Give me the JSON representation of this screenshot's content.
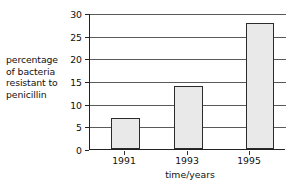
{
  "chart_data": {
    "type": "bar",
    "title": "",
    "subtitle": "",
    "categories": [
      "1991",
      "1993",
      "1995"
    ],
    "values": [
      7,
      14,
      28
    ],
    "xlabel": "time/years",
    "ylabel": "percentage of bacteria resistant to penicillin",
    "ylabel_lines": [
      "percentage",
      "of bacteria",
      "resistant to",
      "penicillin"
    ],
    "ylim": [
      0,
      30
    ],
    "ytick_labels": [
      "0",
      "5",
      "10",
      "15",
      "20",
      "25",
      "30"
    ],
    "ytick_values": [
      0,
      5,
      10,
      15,
      20,
      25,
      30
    ],
    "ytick_step": 5,
    "grid": true,
    "grid_orientation": "horizontal",
    "legend": false,
    "legend_position": "none",
    "series": [
      {
        "name": "percentage of bacteria resistant to penicillin",
        "values": [
          7,
          14,
          28
        ]
      }
    ],
    "colors": {
      "bar_fill": "#e9e9e9",
      "bar_border": "#2b2b2b",
      "axis": "#222222",
      "gridline": "#5a5a5a",
      "background": "#ffffff",
      "text": "#111111"
    }
  }
}
